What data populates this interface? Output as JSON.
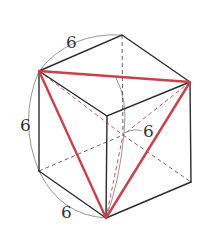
{
  "diagram": {
    "type": "cube-with-inscribed-triangle",
    "colors": {
      "edge": "#2b2b2b",
      "triangle": "#c8414b",
      "dimension_arc": "#8a8a8a"
    },
    "labels": {
      "top_edge": "6",
      "left_edge": "6",
      "bottom_edge": "6",
      "inner_height": "6"
    }
  }
}
